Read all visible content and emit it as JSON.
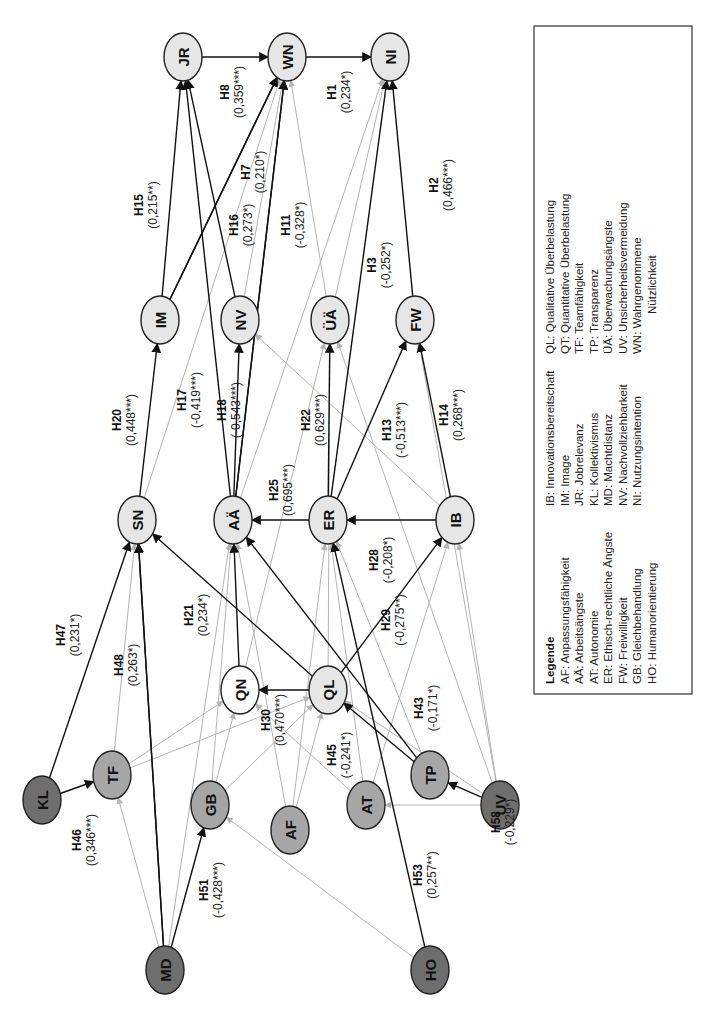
{
  "diagram": {
    "orientation": "rotated -90deg (reads bottom-to-top)",
    "colors": {
      "node_light": "#e6e6e6",
      "node_mid": "#a6a6a6",
      "node_dark": "#6e6e6e",
      "node_white": "#ffffff",
      "edge_significant": "#111111",
      "edge_nonsignificant": "#b4b4b4"
    },
    "nodes": [
      {
        "id": "JR",
        "x": 183,
        "y": 57,
        "fill": "light"
      },
      {
        "id": "WN",
        "x": 287,
        "y": 57,
        "fill": "light"
      },
      {
        "id": "NI",
        "x": 390,
        "y": 57,
        "fill": "light"
      },
      {
        "id": "IM",
        "x": 160,
        "y": 320,
        "fill": "light"
      },
      {
        "id": "NV",
        "x": 240,
        "y": 320,
        "fill": "light"
      },
      {
        "id": "ÜÄ",
        "x": 330,
        "y": 320,
        "fill": "light"
      },
      {
        "id": "FW",
        "x": 415,
        "y": 320,
        "fill": "light"
      },
      {
        "id": "SN",
        "x": 137,
        "y": 520,
        "fill": "light"
      },
      {
        "id": "AÄ",
        "x": 233,
        "y": 520,
        "fill": "light"
      },
      {
        "id": "ER",
        "x": 328,
        "y": 520,
        "fill": "light"
      },
      {
        "id": "IB",
        "x": 455,
        "y": 520,
        "fill": "light"
      },
      {
        "id": "QN",
        "x": 240,
        "y": 690,
        "fill": "white"
      },
      {
        "id": "QL",
        "x": 328,
        "y": 690,
        "fill": "light"
      },
      {
        "id": "KL",
        "x": 42,
        "y": 800,
        "fill": "dark"
      },
      {
        "id": "TF",
        "x": 112,
        "y": 775,
        "fill": "mid"
      },
      {
        "id": "GB",
        "x": 210,
        "y": 805,
        "fill": "mid"
      },
      {
        "id": "AF",
        "x": 290,
        "y": 830,
        "fill": "mid"
      },
      {
        "id": "AT",
        "x": 366,
        "y": 805,
        "fill": "mid"
      },
      {
        "id": "TP",
        "x": 430,
        "y": 775,
        "fill": "mid"
      },
      {
        "id": "UV",
        "x": 500,
        "y": 805,
        "fill": "dark"
      },
      {
        "id": "MD",
        "x": 165,
        "y": 970,
        "fill": "dark"
      },
      {
        "id": "HO",
        "x": 430,
        "y": 970,
        "fill": "dark"
      }
    ],
    "hypotheses": [
      {
        "id": "H1",
        "from": "WN",
        "to": "NI",
        "coef": "(0,234*)",
        "lx": 338,
        "ly": 92
      },
      {
        "id": "H2",
        "from": "FW",
        "to": "NI",
        "coef": "(0,466***)",
        "lx": 440,
        "ly": 185
      },
      {
        "id": "H3",
        "from": "ER",
        "to": "NI",
        "coef": "(-0,252*)",
        "lx": 378,
        "ly": 265
      },
      {
        "id": "H7",
        "from": "IM",
        "to": "WN",
        "coef": "(0,210*)",
        "lx": 252,
        "ly": 172
      },
      {
        "id": "H8",
        "from": "JR",
        "to": "WN",
        "coef": "(0,359***)",
        "lx": 231,
        "ly": 92
      },
      {
        "id": "H11",
        "from": "AÄ",
        "to": "WN",
        "coef": "(-0,328*)",
        "lx": 292,
        "ly": 225
      },
      {
        "id": "H15",
        "from": "IM",
        "to": "JR",
        "coef": "(0,215**)",
        "lx": 145,
        "ly": 205
      },
      {
        "id": "H16",
        "from": "NV",
        "to": "JR",
        "coef": "(0,273*)",
        "lx": 240,
        "ly": 225
      },
      {
        "id": "H17",
        "from": "AÄ",
        "to": "JR",
        "coef": "(-0,419***)",
        "lx": 188,
        "ly": 400
      },
      {
        "id": "H18",
        "from": "AÄ",
        "to": "NV",
        "coef": "(-0,543***)",
        "lx": 228,
        "ly": 410
      },
      {
        "id": "H20",
        "from": "SN",
        "to": "IM",
        "coef": "(0,448***)",
        "lx": 123,
        "ly": 420
      },
      {
        "id": "H21",
        "from": "QN",
        "to": "AÄ",
        "coef": "(0,234*)",
        "lx": 195,
        "ly": 615
      },
      {
        "id": "H22",
        "from": "ER",
        "to": "ÜÄ",
        "coef": "(0,629***)",
        "lx": 312,
        "ly": 420
      },
      {
        "id": "H25",
        "from": "ER",
        "to": "AÄ",
        "coef": "(0,695***)",
        "lx": 280,
        "ly": 490
      },
      {
        "id": "H28",
        "from": "IB",
        "to": "ER",
        "coef": "(-0,208*)",
        "lx": 380,
        "ly": 560
      },
      {
        "id": "H29",
        "from": "QL",
        "to": "IB",
        "coef": "(-0,275**)",
        "lx": 392,
        "ly": 620
      },
      {
        "id": "H13",
        "from": "ER",
        "to": "FW",
        "coef": "(-0,513***)",
        "lx": 393,
        "ly": 430
      },
      {
        "id": "H14",
        "from": "IB",
        "to": "FW",
        "coef": "(0,268***)",
        "lx": 450,
        "ly": 415
      },
      {
        "id": "H30",
        "from": "QL",
        "to": "QN",
        "coef": "(0,470***)",
        "lx": 272,
        "ly": 720
      },
      {
        "id": "H43",
        "from": "TP",
        "to": "AÄ",
        "coef": "(-0,171*)",
        "lx": 425,
        "ly": 708
      },
      {
        "id": "H45",
        "from": "TP",
        "to": "QL",
        "coef": "(-0,241*)",
        "lx": 338,
        "ly": 755
      },
      {
        "id": "H46",
        "from": "KL",
        "to": "TF",
        "coef": "(0,346***)",
        "lx": 83,
        "ly": 840
      },
      {
        "id": "H47",
        "from": "KL",
        "to": "SN",
        "coef": "(0,231*)",
        "lx": 67,
        "ly": 635
      },
      {
        "id": "H48",
        "from": "MD",
        "to": "SN",
        "coef": "(0,263*)",
        "lx": 125,
        "ly": 665
      },
      {
        "id": "H51",
        "from": "MD",
        "to": "GB",
        "coef": "(-0,428***)",
        "lx": 210,
        "ly": 890
      },
      {
        "id": "H53",
        "from": "HO",
        "to": "ER",
        "coef": "(0,257**)",
        "lx": 424,
        "ly": 875
      },
      {
        "id": "H58",
        "from": "UV",
        "to": "TP",
        "coef": "(-0,229*)",
        "lx": 502,
        "ly": 822
      }
    ],
    "significant_edges_extra": [
      {
        "from": "IM",
        "to": "WN"
      },
      {
        "from": "AÄ",
        "to": "WN"
      },
      {
        "from": "QL",
        "to": "SN"
      },
      {
        "from": "MD",
        "to": "SN"
      }
    ],
    "nonsignificant_edges": [
      {
        "from": "SN",
        "to": "WN"
      },
      {
        "from": "NV",
        "to": "WN"
      },
      {
        "from": "ÜÄ",
        "to": "WN"
      },
      {
        "from": "AÄ",
        "to": "NI"
      },
      {
        "from": "ÜÄ",
        "to": "NI"
      },
      {
        "from": "IB",
        "to": "NV"
      },
      {
        "from": "QN",
        "to": "ÜÄ"
      },
      {
        "from": "QL",
        "to": "ÜÄ"
      },
      {
        "from": "UV",
        "to": "ÜÄ"
      },
      {
        "from": "UV",
        "to": "FW"
      },
      {
        "from": "UV",
        "to": "IB"
      },
      {
        "from": "UV",
        "to": "QL"
      },
      {
        "from": "AT",
        "to": "IB"
      },
      {
        "from": "AT",
        "to": "ER"
      },
      {
        "from": "TP",
        "to": "ER"
      },
      {
        "from": "AF",
        "to": "AÄ"
      },
      {
        "from": "AF",
        "to": "QL"
      },
      {
        "from": "AF",
        "to": "ER"
      },
      {
        "from": "GB",
        "to": "QN"
      },
      {
        "from": "GB",
        "to": "QL"
      },
      {
        "from": "TF",
        "to": "QN"
      },
      {
        "from": "TF",
        "to": "QL"
      },
      {
        "from": "TF",
        "to": "SN"
      },
      {
        "from": "MD",
        "to": "TF"
      },
      {
        "from": "MD",
        "to": "AÄ"
      },
      {
        "from": "HO",
        "to": "GB"
      },
      {
        "from": "UV",
        "to": "AT"
      },
      {
        "from": "AT",
        "to": "QN"
      },
      {
        "from": "GB",
        "to": "AÄ"
      }
    ]
  },
  "legend": {
    "title": "Legende",
    "columns": [
      [
        "AF: Anpassungsfähigkeit",
        "AÄ: Arbeitsängste",
        "AT: Autonomie",
        "ER: Ethisch-rechtliche Ängste",
        "FW: Freiwilligkeit",
        "GB: Gleichbehandlung",
        "HO: Humanorientierung"
      ],
      [
        "IB: Innovationsbereitschaft",
        "IM: Image",
        "JR: Jobrelevanz",
        "KL: Kollektivismus",
        "MD: Machtdistanz",
        "NV: Nachvollziehbarkeit",
        "NI: Nutzungsintention"
      ],
      [
        "QL: Qualitative Überbelastung",
        "QT: Quantitative Überbelastung",
        "TF: Teamfähigkeit",
        "TP: Transparenz",
        "ÜÄ: Überwachungsängste",
        "UV: Unsicherheitsvermeidung",
        "WN: Wahrgenommene",
        "Nützlichkeit"
      ]
    ]
  }
}
